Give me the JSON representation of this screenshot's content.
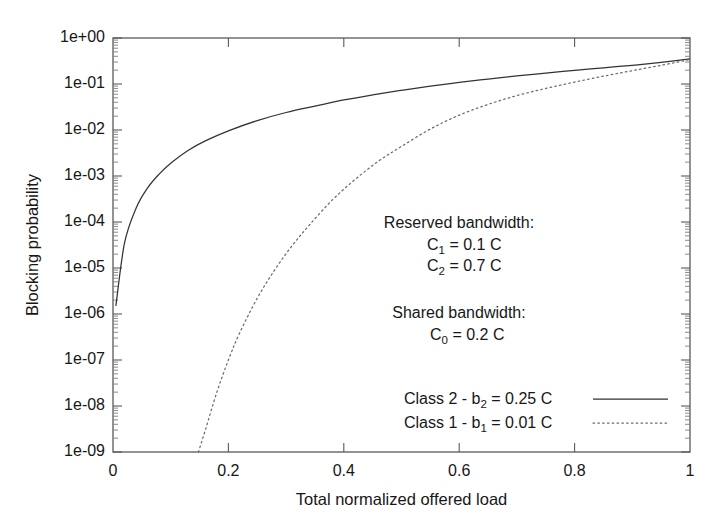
{
  "chart_data": {
    "type": "line",
    "title": "",
    "xlabel": "Total normalized offered load",
    "ylabel": "Blocking probability",
    "xlim": [
      0,
      1
    ],
    "ylim": [
      1e-09,
      1
    ],
    "yscale": "log",
    "xscale": "linear",
    "grid": false,
    "legend_position": "inside-lower-right",
    "xticks": [
      "0",
      "0.2",
      "0.4",
      "0.6",
      "0.8",
      "1"
    ],
    "xtick_values": [
      0,
      0.2,
      0.4,
      0.6,
      0.8,
      1
    ],
    "yticks": [
      "1e+00",
      "1e-01",
      "1e-02",
      "1e-03",
      "1e-04",
      "1e-05",
      "1e-06",
      "1e-07",
      "1e-08",
      "1e-09"
    ],
    "ytick_values": [
      1,
      0.1,
      0.01,
      0.001,
      0.0001,
      1e-05,
      1e-06,
      1e-07,
      1e-08,
      1e-09
    ],
    "series": [
      {
        "name": "Class 2 - b2 = 0.25 C",
        "style": "solid",
        "color": "#333333",
        "x": [
          0.005,
          0.02,
          0.04,
          0.06,
          0.08,
          0.1,
          0.13,
          0.16,
          0.2,
          0.25,
          0.3,
          0.35,
          0.4,
          0.45,
          0.5,
          0.55,
          0.6,
          0.65,
          0.7,
          0.75,
          0.8,
          0.85,
          0.9,
          0.95,
          1.0
        ],
        "y": [
          1.5e-06,
          3.5e-05,
          0.0002,
          0.00055,
          0.0011,
          0.0019,
          0.0036,
          0.0058,
          0.0096,
          0.016,
          0.024,
          0.033,
          0.045,
          0.058,
          0.073,
          0.09,
          0.108,
          0.128,
          0.15,
          0.173,
          0.198,
          0.225,
          0.255,
          0.295,
          0.35
        ]
      },
      {
        "name": "Class 1 - b1 = 0.01 C",
        "style": "dotted",
        "color": "#6b6b6b",
        "x": [
          0.148,
          0.16,
          0.18,
          0.2,
          0.22,
          0.25,
          0.28,
          0.31,
          0.34,
          0.38,
          0.42,
          0.46,
          0.5,
          0.55,
          0.6,
          0.65,
          0.7,
          0.75,
          0.8,
          0.85,
          0.9,
          0.95,
          1.0
        ],
        "y": [
          1e-09,
          3e-09,
          2e-08,
          1e-07,
          4e-07,
          2.2e-06,
          9e-06,
          3e-05,
          8.5e-05,
          0.0003,
          0.00085,
          0.0021,
          0.0044,
          0.0105,
          0.021,
          0.036,
          0.056,
          0.08,
          0.11,
          0.148,
          0.195,
          0.255,
          0.34
        ]
      }
    ],
    "annotations": [
      {
        "id": "reserved-heading",
        "text": "Reserved bandwidth:"
      },
      {
        "id": "reserved-c1",
        "base": "C",
        "subscript": "1",
        "rest": " = 0.1 C"
      },
      {
        "id": "reserved-c2",
        "base": "C",
        "subscript": "2",
        "rest": " = 0.7 C"
      },
      {
        "id": "shared-heading",
        "text": "Shared bandwidth:"
      },
      {
        "id": "shared-c0",
        "base": "C",
        "subscript": "0",
        "rest": " = 0.2 C"
      }
    ],
    "legend": [
      {
        "prefix": "Class 2 - b",
        "subscript": "2",
        "rest": " = 0.25 C",
        "style": "solid"
      },
      {
        "prefix": "Class 1 - b",
        "subscript": "1",
        "rest": " = 0.01 C",
        "style": "dotted"
      }
    ]
  },
  "axes": {
    "xlabel": "Total normalized offered load",
    "ylabel": "Blocking probability",
    "xticks": [
      "0",
      "0.2",
      "0.4",
      "0.6",
      "0.8",
      "1"
    ],
    "yticks": [
      "1e+00",
      "1e-01",
      "1e-02",
      "1e-03",
      "1e-04",
      "1e-05",
      "1e-06",
      "1e-07",
      "1e-08",
      "1e-09"
    ]
  },
  "annotations": {
    "reserved_heading": "Reserved bandwidth:",
    "reserved_c1_base": "C",
    "reserved_c1_sub": "1",
    "reserved_c1_rest": " = 0.1 C",
    "reserved_c2_base": "C",
    "reserved_c2_sub": "2",
    "reserved_c2_rest": " = 0.7 C",
    "shared_heading": "Shared bandwidth:",
    "shared_c0_base": "C",
    "shared_c0_sub": "0",
    "shared_c0_rest": " = 0.2 C"
  },
  "legend": {
    "entry1_prefix": "Class 2 - b",
    "entry1_sub": "2",
    "entry1_rest": " = 0.25 C",
    "entry2_prefix": "Class 1 - b",
    "entry2_sub": "1",
    "entry2_rest": " = 0.01 C"
  },
  "colors": {
    "solid_curve": "#333333",
    "dotted_curve": "#6b6b6b",
    "frame": "#5a5a5a",
    "text": "#171717",
    "background": "#ffffff"
  }
}
